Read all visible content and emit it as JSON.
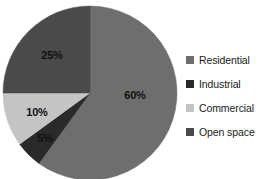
{
  "chart_data": {
    "type": "pie",
    "title": "",
    "categories": [
      "Residential",
      "Industrial",
      "Commercial",
      "Open space"
    ],
    "values": [
      60,
      5,
      10,
      25
    ],
    "value_labels": [
      "60%",
      "5%",
      "10%",
      "25%"
    ],
    "colors": [
      "#6e6e6e",
      "#2a2a2a",
      "#c4c4c4",
      "#4a4a4a"
    ],
    "units": "percent",
    "start_angle_deg": 0,
    "direction": "clockwise",
    "legend_position": "right",
    "grid": false,
    "background": "#ffffff",
    "slices": [
      {
        "name": "Residential",
        "value": 60,
        "label": "60%",
        "color": "#6e6e6e",
        "label_x": 135,
        "label_y": 95
      },
      {
        "name": "Industrial",
        "value": 5,
        "label": "5%",
        "color": "#2a2a2a",
        "label_x": 45,
        "label_y": 138
      },
      {
        "name": "Commercial",
        "value": 10,
        "label": "10%",
        "color": "#c4c4c4",
        "label_x": 37,
        "label_y": 112
      },
      {
        "name": "Open space",
        "value": 25,
        "label": "25%",
        "color": "#4a4a4a",
        "label_x": 52,
        "label_y": 55
      }
    ],
    "geometry": {
      "center_x": 90,
      "center_y": 93,
      "radius": 87
    }
  },
  "legend": {
    "items": [
      {
        "label": "Residential",
        "color": "#6e6e6e"
      },
      {
        "label": "Industrial",
        "color": "#2a2a2a"
      },
      {
        "label": "Commercial",
        "color": "#c4c4c4"
      },
      {
        "label": "Open space",
        "color": "#4a4a4a"
      }
    ]
  }
}
